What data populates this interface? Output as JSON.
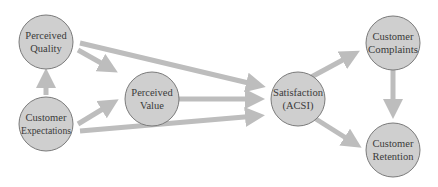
{
  "diagram": {
    "colors": {
      "node_fill": "#cfcfcf",
      "node_stroke": "#7a7a7a",
      "arrow": "#bdbdbd",
      "text": "#3a3a3a",
      "background": "#ffffff"
    },
    "nodes": [
      {
        "id": "perceived-quality",
        "line1": "Perceived",
        "line2": "Quality",
        "cx": 46,
        "cy": 42,
        "r": 27
      },
      {
        "id": "customer-expectations",
        "line1": "Customer",
        "line2": "Expectations",
        "cx": 46,
        "cy": 124,
        "r": 27
      },
      {
        "id": "perceived-value",
        "line1": "Perceived",
        "line2": "Value",
        "cx": 152,
        "cy": 99,
        "r": 27
      },
      {
        "id": "satisfaction",
        "line1": "Satisfaction",
        "line2": "(ACSI)",
        "cx": 298,
        "cy": 99,
        "r": 27
      },
      {
        "id": "customer-complaints",
        "line1": "Customer",
        "line2": "Complaints",
        "cx": 393,
        "cy": 43,
        "r": 27
      },
      {
        "id": "customer-retention",
        "line1": "Customer",
        "line2": "Retention",
        "cx": 393,
        "cy": 150,
        "r": 27
      }
    ],
    "edges": [
      {
        "from": "customer-expectations",
        "to": "perceived-quality"
      },
      {
        "from": "perceived-quality",
        "to": "perceived-value"
      },
      {
        "from": "perceived-quality",
        "to": "satisfaction"
      },
      {
        "from": "customer-expectations",
        "to": "perceived-value"
      },
      {
        "from": "customer-expectations",
        "to": "satisfaction"
      },
      {
        "from": "perceived-value",
        "to": "satisfaction"
      },
      {
        "from": "satisfaction",
        "to": "customer-complaints"
      },
      {
        "from": "satisfaction",
        "to": "customer-retention"
      },
      {
        "from": "customer-complaints",
        "to": "customer-retention"
      }
    ]
  }
}
